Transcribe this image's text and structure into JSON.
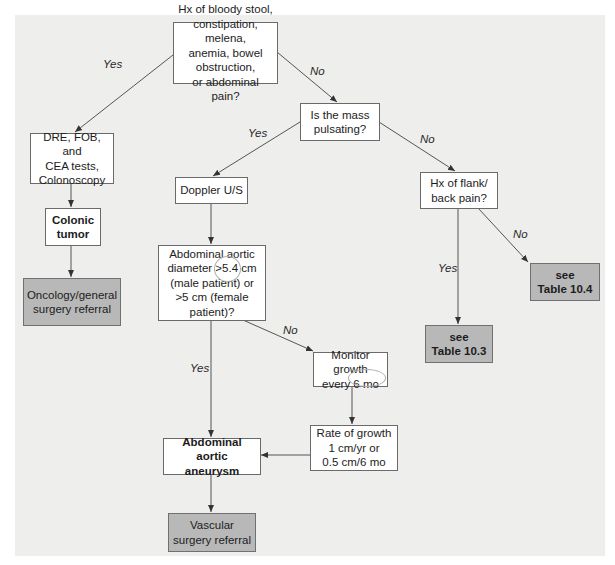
{
  "nodes": {
    "start": "Hx of bloody stool,\nconstipation, melena,\nanemia, bowel obstruction,\nor abdominal pain?",
    "dre": "DRE, FOB, and\nCEA tests,\nColonoscopy",
    "colonic_tumor": "Colonic\ntumor",
    "oncology_referral": "Oncology/general\nsurgery referral",
    "pulsating": "Is the mass\npulsating?",
    "doppler": "Doppler U/S",
    "aortic_diameter": "Abdominal aortic\ndiameter >5.4 cm\n(male patient) or\n>5 cm (female\npatient)?",
    "monitor_growth": "Monitor growth\nevery 6 mo",
    "rate_of_growth": "Rate of growth\n1 cm/yr or\n0.5 cm/6 mo",
    "aaa": "Abdominal aortic\naneurysm",
    "vascular_referral": "Vascular\nsurgery referral",
    "flank_pain": "Hx of flank/\nback pain?",
    "table_10_3": "see\nTable 10.3",
    "table_10_4": "see\nTable 10.4"
  },
  "edge_labels": {
    "start_yes": "Yes",
    "start_no": "No",
    "pulsating_yes": "Yes",
    "pulsating_no": "No",
    "flank_yes": "Yes",
    "flank_no": "No",
    "diameter_yes": "Yes",
    "diameter_no": "No"
  },
  "colors": {
    "panel": "#eeeeec",
    "box": "#ffffff",
    "terminal_box": "#b8b8b8",
    "line": "#555555"
  }
}
